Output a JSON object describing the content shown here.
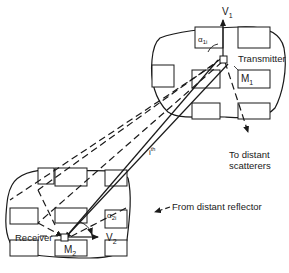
{
  "figure": {
    "type": "mobile-to-mobile propagation diagram",
    "stroke_color": "#1a1a1a",
    "background": "#ffffff"
  },
  "transmitter_area": {
    "label": "Transmitter",
    "station_label": "M",
    "station_sub": "1",
    "velocity_label": "V",
    "velocity_sub": "1",
    "angle_label": "α",
    "angle_sub": "1i"
  },
  "receiver_area": {
    "label": "Receiver",
    "station_label": "M",
    "station_sub": "2",
    "velocity_label": "V",
    "velocity_sub": "2",
    "angle_label": "α",
    "angle_sub": "2i"
  },
  "path": {
    "label": "i",
    "label_sup": "th"
  },
  "annotations": {
    "to_scatterers_line1": "To distant",
    "to_scatterers_line2": "scatterers",
    "from_reflector": "From distant reflector"
  }
}
